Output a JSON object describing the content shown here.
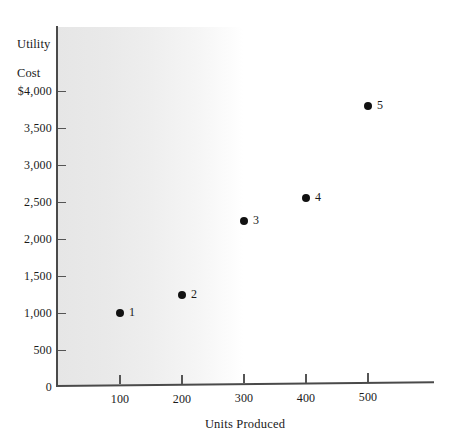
{
  "chart_data": {
    "type": "scatter",
    "title": "",
    "xlabel": "Units Produced",
    "ylabel": "Utility\nCost",
    "ylabel_line1": "Utility",
    "ylabel_line2": "Cost",
    "xlim": [
      0,
      600
    ],
    "ylim": [
      0,
      4250
    ],
    "grid": false,
    "legend": "none",
    "x_ticks": [
      {
        "value": 100,
        "label": "100"
      },
      {
        "value": 200,
        "label": "200"
      },
      {
        "value": 300,
        "label": "300"
      },
      {
        "value": 400,
        "label": "400"
      },
      {
        "value": 500,
        "label": "500"
      }
    ],
    "y_ticks": [
      {
        "value": 4000,
        "label": "$4,000"
      },
      {
        "value": 3500,
        "label": "3,500"
      },
      {
        "value": 3000,
        "label": "3,000"
      },
      {
        "value": 2500,
        "label": "2,500"
      },
      {
        "value": 2000,
        "label": "2,000"
      },
      {
        "value": 1500,
        "label": "1,500"
      },
      {
        "value": 1000,
        "label": "1,000"
      },
      {
        "value": 500,
        "label": "500"
      },
      {
        "value": 0,
        "label": "0"
      }
    ],
    "points": [
      {
        "label": "1",
        "x": 100,
        "y": 1000
      },
      {
        "label": "2",
        "x": 200,
        "y": 1250
      },
      {
        "label": "3",
        "x": 300,
        "y": 2250
      },
      {
        "label": "4",
        "x": 400,
        "y": 2550
      },
      {
        "label": "5",
        "x": 500,
        "y": 3800
      }
    ],
    "colors": {
      "point": "#111111",
      "axis": "#4a4a4a",
      "text": "#1a1a1a",
      "plot_shade_start": "#e6e6e6",
      "plot_shade_end": "#ffffff",
      "background": "#ffffff"
    }
  }
}
